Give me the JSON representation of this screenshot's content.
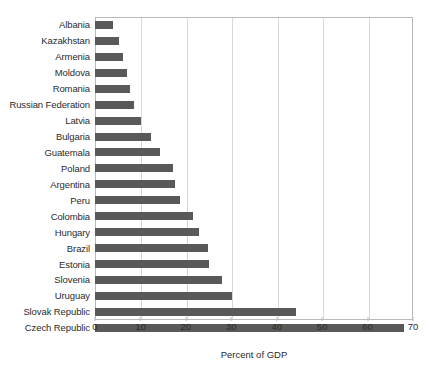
{
  "chart_data": {
    "type": "bar",
    "orientation": "horizontal",
    "title": "",
    "xlabel": "Percent of GDP",
    "ylabel": "",
    "xlim": [
      0,
      70
    ],
    "xticks": [
      0,
      10,
      20,
      30,
      40,
      50,
      60,
      70
    ],
    "grid": "vertical",
    "legend": "none",
    "bar_color": "#595959",
    "categories": [
      "Albania",
      "Kazakhstan",
      "Armenia",
      "Moldova",
      "Romania",
      "Russian Federation",
      "Latvia",
      "Bulgaria",
      "Guatemala",
      "Poland",
      "Argentina",
      "Peru",
      "Colombia",
      "Hungary",
      "Brazil",
      "Estonia",
      "Slovenia",
      "Uruguay",
      "Slovak Republic",
      "Czech Republic"
    ],
    "values": [
      4.0,
      5.3,
      6.2,
      7.0,
      7.8,
      8.6,
      10.2,
      12.3,
      14.3,
      17.2,
      17.5,
      18.7,
      21.5,
      23.0,
      24.8,
      25.2,
      28.0,
      30.2,
      44.2,
      68.0
    ]
  }
}
